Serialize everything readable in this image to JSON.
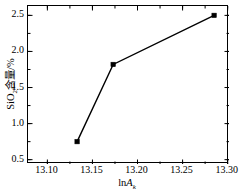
{
  "chart_data": {
    "type": "line",
    "title": "",
    "xlabel": "lnA_k",
    "xlabel_parts": {
      "prefix": "ln",
      "italic": "A",
      "sub": "k"
    },
    "ylabel": "SiO2含量/%",
    "ylabel_parts": {
      "lead": "SiO",
      "sub": "2",
      "tail": "含量/%"
    },
    "x": [
      13.133,
      13.173,
      13.285
    ],
    "values": [
      0.75,
      1.82,
      2.5
    ],
    "xlim": [
      13.0785,
      13.3015
    ],
    "ylim": [
      0.44,
      2.63
    ],
    "xticks": [
      13.1,
      13.15,
      13.2,
      13.25,
      13.3
    ],
    "xtick_labels": [
      "13.10",
      "13.15",
      "13.20",
      "13.25",
      "13.30"
    ],
    "yticks": [
      0.5,
      1.0,
      1.5,
      2.0,
      2.5
    ],
    "ytick_labels": [
      "0.5",
      "1.0",
      "1.5",
      "2.0",
      "2.5"
    ],
    "xminor_step": 0.025,
    "yminor_step": 0.25,
    "grid": false,
    "legend": null,
    "series_color": "#000000",
    "marker": "square",
    "marker_size": 4.5,
    "line_width": 1.4,
    "frame_color": "#000000",
    "background": "#ffffff"
  }
}
